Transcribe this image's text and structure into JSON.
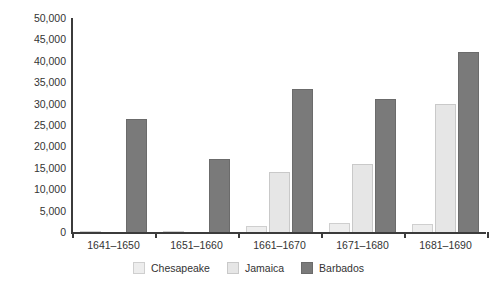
{
  "chart_data": {
    "type": "bar",
    "title": "",
    "subtitle": "",
    "xlabel": "",
    "ylabel": "",
    "ylim": [
      0,
      50000
    ],
    "ytick_values": [
      0,
      5000,
      10000,
      15000,
      20000,
      25000,
      30000,
      35000,
      40000,
      45000,
      50000
    ],
    "ytick_labels": [
      "0",
      "5,000",
      "10,000",
      "15,000",
      "20,000",
      "25,000",
      "30,000",
      "35,000",
      "40,000",
      "45,000",
      "50,000"
    ],
    "grid": false,
    "legend_position": "bottom",
    "categories": [
      "1641–1650",
      "1651–1660",
      "1661–1670",
      "1671–1680",
      "1681–1690"
    ],
    "series": [
      {
        "name": "Chesapeake",
        "color": "#ededed",
        "values": [
          200,
          300,
          1500,
          2000,
          1800
        ]
      },
      {
        "name": "Jamaica",
        "color": "#e6e6e6",
        "values": [
          0,
          0,
          14000,
          16000,
          30000
        ]
      },
      {
        "name": "Barbados",
        "color": "#7a7a7a",
        "values": [
          26500,
          17000,
          33500,
          31000,
          42000
        ]
      }
    ]
  },
  "legend": {
    "items": [
      {
        "label": "Chesapeake",
        "key": "chesapeake"
      },
      {
        "label": "Jamaica",
        "key": "jamaica"
      },
      {
        "label": "Barbados",
        "key": "barbados"
      }
    ]
  }
}
